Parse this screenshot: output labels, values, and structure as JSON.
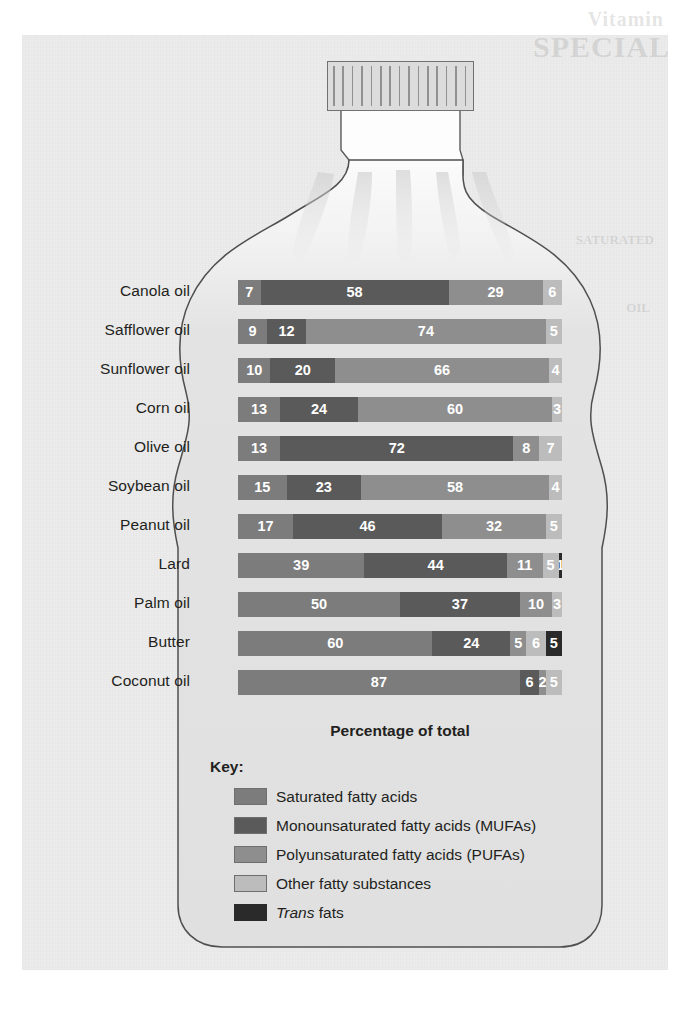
{
  "figure": {
    "axis_caption": "Percentage of total",
    "key_title": "Key:",
    "bottle_cap_icon": "bottle-cap-ridged"
  },
  "ghost_text": {
    "line1": "Vitamin",
    "line2": "SPECIAL",
    "line3": "SATURATED",
    "line4": "OIL"
  },
  "legend": [
    {
      "key": "sat",
      "label": "Saturated fatty acids",
      "color": "#7c7c7c"
    },
    {
      "key": "mufa",
      "label": "Monounsaturated fatty acids (MUFAs)",
      "color": "#5a5a5a"
    },
    {
      "key": "pufa",
      "label": "Polyunsaturated fatty acids (PUFAs)",
      "color": "#8e8e8e"
    },
    {
      "key": "other",
      "label": "Other fatty substances",
      "color": "#bcbcbc"
    },
    {
      "key": "trans",
      "label_html": "<em>Trans</em> fats",
      "label": "Trans fats",
      "color": "#2a2a2a"
    }
  ],
  "chart_data": {
    "type": "bar",
    "subtype": "stacked-horizontal-100",
    "title": "",
    "xlabel": "Percentage of total",
    "ylabel": "",
    "xlim": [
      0,
      100
    ],
    "grid": false,
    "legend_position": "below-plot",
    "categories": [
      "Canola oil",
      "Safflower oil",
      "Sunflower oil",
      "Corn oil",
      "Olive oil",
      "Soybean oil",
      "Peanut oil",
      "Lard",
      "Palm oil",
      "Butter",
      "Coconut oil"
    ],
    "series": [
      {
        "name": "Saturated fatty acids",
        "key": "sat",
        "color": "#7c7c7c",
        "values": [
          7,
          9,
          10,
          13,
          13,
          15,
          17,
          39,
          50,
          60,
          87
        ]
      },
      {
        "name": "Monounsaturated fatty acids (MUFAs)",
        "key": "mufa",
        "color": "#5a5a5a",
        "values": [
          58,
          12,
          20,
          24,
          72,
          23,
          46,
          44,
          37,
          24,
          6
        ]
      },
      {
        "name": "Polyunsaturated fatty acids (PUFAs)",
        "key": "pufa",
        "color": "#8e8e8e",
        "values": [
          29,
          74,
          66,
          60,
          8,
          58,
          32,
          11,
          10,
          5,
          2
        ]
      },
      {
        "name": "Other fatty substances",
        "key": "other",
        "color": "#bcbcbc",
        "values": [
          6,
          5,
          4,
          3,
          7,
          4,
          5,
          5,
          3,
          6,
          5
        ]
      },
      {
        "name": "Trans fats",
        "key": "trans",
        "color": "#2a2a2a",
        "values": [
          0,
          0,
          0,
          0,
          0,
          0,
          0,
          1,
          0,
          5,
          0
        ]
      }
    ],
    "rows": [
      {
        "label": "Canola oil",
        "segments": [
          {
            "key": "sat",
            "value": 7
          },
          {
            "key": "mufa",
            "value": 58
          },
          {
            "key": "pufa",
            "value": 29
          },
          {
            "key": "other",
            "value": 6
          }
        ]
      },
      {
        "label": "Safflower oil",
        "segments": [
          {
            "key": "sat",
            "value": 9
          },
          {
            "key": "mufa",
            "value": 12
          },
          {
            "key": "pufa",
            "value": 74
          },
          {
            "key": "other",
            "value": 5
          }
        ]
      },
      {
        "label": "Sunflower oil",
        "segments": [
          {
            "key": "sat",
            "value": 10
          },
          {
            "key": "mufa",
            "value": 20
          },
          {
            "key": "pufa",
            "value": 66
          },
          {
            "key": "other",
            "value": 4
          }
        ]
      },
      {
        "label": "Corn oil",
        "segments": [
          {
            "key": "sat",
            "value": 13
          },
          {
            "key": "mufa",
            "value": 24
          },
          {
            "key": "pufa",
            "value": 60
          },
          {
            "key": "other",
            "value": 3
          }
        ]
      },
      {
        "label": "Olive oil",
        "segments": [
          {
            "key": "sat",
            "value": 13
          },
          {
            "key": "mufa",
            "value": 72
          },
          {
            "key": "pufa",
            "value": 8
          },
          {
            "key": "other",
            "value": 7
          }
        ]
      },
      {
        "label": "Soybean oil",
        "segments": [
          {
            "key": "sat",
            "value": 15
          },
          {
            "key": "mufa",
            "value": 23
          },
          {
            "key": "pufa",
            "value": 58
          },
          {
            "key": "other",
            "value": 4
          }
        ]
      },
      {
        "label": "Peanut oil",
        "segments": [
          {
            "key": "sat",
            "value": 17
          },
          {
            "key": "mufa",
            "value": 46
          },
          {
            "key": "pufa",
            "value": 32
          },
          {
            "key": "other",
            "value": 5
          }
        ]
      },
      {
        "label": "Lard",
        "segments": [
          {
            "key": "sat",
            "value": 39
          },
          {
            "key": "mufa",
            "value": 44
          },
          {
            "key": "pufa",
            "value": 11
          },
          {
            "key": "other",
            "value": 5
          },
          {
            "key": "trans",
            "value": 1
          }
        ]
      },
      {
        "label": "Palm oil",
        "segments": [
          {
            "key": "sat",
            "value": 50
          },
          {
            "key": "mufa",
            "value": 37
          },
          {
            "key": "pufa",
            "value": 10
          },
          {
            "key": "other",
            "value": 3
          }
        ]
      },
      {
        "label": "Butter",
        "segments": [
          {
            "key": "sat",
            "value": 60
          },
          {
            "key": "mufa",
            "value": 24
          },
          {
            "key": "pufa",
            "value": 5
          },
          {
            "key": "other",
            "value": 6
          },
          {
            "key": "trans",
            "value": 5
          }
        ]
      },
      {
        "label": "Coconut oil",
        "segments": [
          {
            "key": "sat",
            "value": 87
          },
          {
            "key": "mufa",
            "value": 6
          },
          {
            "key": "pufa",
            "value": 2
          },
          {
            "key": "other",
            "value": 5
          }
        ]
      }
    ]
  }
}
